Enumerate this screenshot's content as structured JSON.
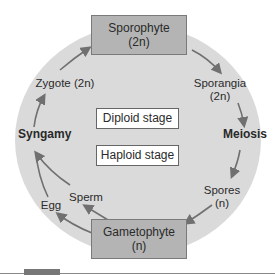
{
  "diagram": {
    "nodes": {
      "sporophyte": {
        "name": "Sporophyte",
        "ploidy": "(2n)"
      },
      "sporangia": {
        "name": "Sporangia",
        "ploidy": "(2n)"
      },
      "meiosis": "Meiosis",
      "spores": {
        "name": "Spores",
        "ploidy": "(n)"
      },
      "gametophyte": {
        "name": "Gametophyte",
        "ploidy": "(n)"
      },
      "sperm": "Sperm",
      "egg": "Egg",
      "syngamy": "Syngamy",
      "zygote": "Zygote (2n)"
    },
    "stages": {
      "diploid": "Diploid stage",
      "haploid": "Haploid stage"
    },
    "colors": {
      "circle_fill": "#dadada",
      "box_fill": "#b4b4b4",
      "arrow": "#707070"
    }
  }
}
